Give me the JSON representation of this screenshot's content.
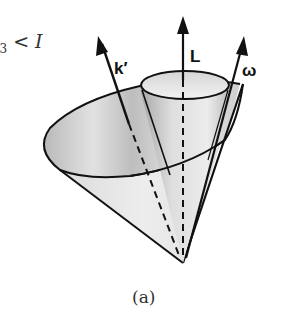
{
  "figure": {
    "condition_label": "I3 < I",
    "condition_parts": {
      "lhs_tail": "I",
      "subscript": "3",
      "relation": "<",
      "rhs": "I"
    },
    "vectors": [
      {
        "id": "k-prime",
        "label": "k′"
      },
      {
        "id": "L",
        "label": "L"
      },
      {
        "id": "omega",
        "label": "ω"
      }
    ],
    "caption": "(a)",
    "colors": {
      "ink": "#111111",
      "cone_light": "#e8e8e8",
      "cone_mid": "#c8c8c8",
      "cone_dark": "#9a9a9a",
      "background": "#ffffff"
    }
  }
}
